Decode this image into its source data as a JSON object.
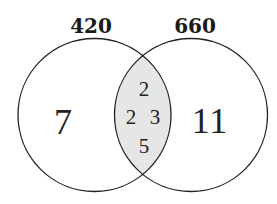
{
  "diagram": {
    "type": "venn",
    "colors": {
      "background": "#ffffff",
      "outline": "#222222",
      "intersection_fill": "#e6e6e6",
      "text": "#222222"
    },
    "sets": [
      {
        "label": "420",
        "exclusive_factors": [
          "7"
        ]
      },
      {
        "label": "660",
        "exclusive_factors": [
          "11"
        ]
      }
    ],
    "intersection": {
      "factors": [
        "2",
        "2",
        "3",
        "5"
      ]
    }
  }
}
